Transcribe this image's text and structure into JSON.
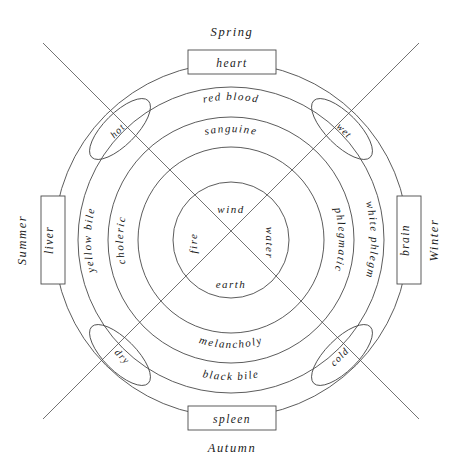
{
  "diagram": {
    "center": {
      "x": 231,
      "y": 240
    },
    "radii": {
      "outer": 177,
      "r2": 153,
      "r3": 123,
      "r4": 93,
      "inner": 58
    },
    "seasons": [
      {
        "name": "season-spring",
        "label": "Spring",
        "position": "top"
      },
      {
        "name": "season-summer",
        "label": "Summer",
        "position": "left"
      },
      {
        "name": "season-autumn",
        "label": "Autumn",
        "position": "bottom"
      },
      {
        "name": "season-winter",
        "label": "Winter",
        "position": "right"
      }
    ],
    "organs": [
      {
        "name": "organ-heart",
        "label": "heart",
        "position": "top"
      },
      {
        "name": "organ-liver",
        "label": "liver",
        "position": "left"
      },
      {
        "name": "organ-spleen",
        "label": "spleen",
        "position": "bottom"
      },
      {
        "name": "organ-brain",
        "label": "brain",
        "position": "right"
      }
    ],
    "qualities": [
      {
        "name": "quality-hot",
        "label": "hot",
        "position": "top-left"
      },
      {
        "name": "quality-wet",
        "label": "wet",
        "position": "top-right"
      },
      {
        "name": "quality-dry",
        "label": "dry",
        "position": "bottom-left"
      },
      {
        "name": "quality-cold",
        "label": "cold",
        "position": "bottom-right"
      }
    ],
    "humours": [
      {
        "name": "humour-red-blood",
        "label": "red blood",
        "position": "top"
      },
      {
        "name": "humour-yellow-bile",
        "label": "yellow bile",
        "position": "left"
      },
      {
        "name": "humour-black-bile",
        "label": "black bile",
        "position": "bottom"
      },
      {
        "name": "humour-white-phlegm",
        "label": "white phlegm",
        "position": "right"
      }
    ],
    "temperaments": [
      {
        "name": "temperament-sanguine",
        "label": "sanguine",
        "position": "top"
      },
      {
        "name": "temperament-choleric",
        "label": "choleric",
        "position": "left"
      },
      {
        "name": "temperament-melancholy",
        "label": "melancholy",
        "position": "bottom"
      },
      {
        "name": "temperament-phlegmatic",
        "label": "phlegmatic",
        "position": "right"
      }
    ],
    "elements": [
      {
        "name": "element-wind",
        "label": "wind",
        "position": "top"
      },
      {
        "name": "element-fire",
        "label": "fire",
        "position": "left"
      },
      {
        "name": "element-earth",
        "label": "earth",
        "position": "bottom"
      },
      {
        "name": "element-water",
        "label": "water",
        "position": "right"
      }
    ],
    "colors": {
      "stroke": "#4a4a4a",
      "text": "#1a1a1a",
      "background": "#ffffff"
    }
  }
}
